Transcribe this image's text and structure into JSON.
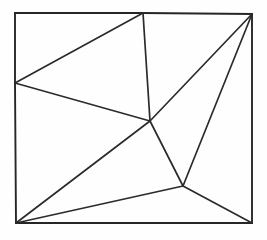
{
  "figure": {
    "canvas": {
      "width": 267,
      "height": 240,
      "background_color": "#fefefe"
    },
    "style": {
      "line_color": "#2b2b2b",
      "frame_color": "#262626",
      "frame_stroke_width": 1.9,
      "interior_stroke_width": 1.7,
      "fill": "none"
    },
    "vertices": [
      {
        "id": "top-left-corner",
        "x": 15,
        "y": 13,
        "on_boundary": true,
        "degree": 2
      },
      {
        "id": "top-edge-node",
        "x": 143,
        "y": 13,
        "on_boundary": true,
        "degree": 4
      },
      {
        "id": "top-right-corner",
        "x": 252,
        "y": 14,
        "on_boundary": true,
        "degree": 4
      },
      {
        "id": "left-edge-node",
        "x": 15,
        "y": 83,
        "on_boundary": true,
        "degree": 4
      },
      {
        "id": "central-hub",
        "x": 150,
        "y": 121,
        "on_boundary": false,
        "degree": 5
      },
      {
        "id": "lower-right-node",
        "x": 183,
        "y": 186,
        "on_boundary": false,
        "degree": 4
      },
      {
        "id": "bottom-left-corner",
        "x": 16,
        "y": 223,
        "on_boundary": true,
        "degree": 4
      },
      {
        "id": "bottom-right-corner",
        "x": 252,
        "y": 223,
        "on_boundary": true,
        "degree": 3
      }
    ],
    "frame_edges": [
      {
        "id": "frame-top-left-segment",
        "x1": 15,
        "y1": 13,
        "x2": 143,
        "y2": 13
      },
      {
        "id": "frame-top-right-segment",
        "x1": 143,
        "y1": 13,
        "x2": 252,
        "y2": 14
      },
      {
        "id": "frame-right",
        "x1": 252,
        "y1": 14,
        "x2": 252,
        "y2": 223
      },
      {
        "id": "frame-bottom",
        "x1": 252,
        "y1": 223,
        "x2": 16,
        "y2": 223
      },
      {
        "id": "frame-left-lower-segment",
        "x1": 16,
        "y1": 223,
        "x2": 15,
        "y2": 83
      },
      {
        "id": "frame-left-upper-segment",
        "x1": 15,
        "y1": 83,
        "x2": 15,
        "y2": 13
      }
    ],
    "interior_edges": [
      {
        "id": "edge-leftnode-to-topnode",
        "from": "left-edge-node",
        "to": "top-edge-node",
        "x1": 15,
        "y1": 83,
        "x2": 143,
        "y2": 13
      },
      {
        "id": "edge-leftnode-to-hub",
        "from": "left-edge-node",
        "to": "central-hub",
        "x1": 15,
        "y1": 83,
        "x2": 150,
        "y2": 121
      },
      {
        "id": "edge-topnode-to-hub",
        "from": "top-edge-node",
        "to": "central-hub",
        "x1": 143,
        "y1": 13,
        "x2": 150,
        "y2": 121
      },
      {
        "id": "edge-hub-to-topright",
        "from": "central-hub",
        "to": "top-right-corner",
        "x1": 150,
        "y1": 121,
        "x2": 252,
        "y2": 14
      },
      {
        "id": "edge-hub-to-lowerright",
        "from": "central-hub",
        "to": "lower-right-node",
        "x1": 150,
        "y1": 121,
        "x2": 183,
        "y2": 186
      },
      {
        "id": "edge-hub-to-bottomleft",
        "from": "central-hub",
        "to": "bottom-left-corner",
        "x1": 150,
        "y1": 121,
        "x2": 16,
        "y2": 223
      },
      {
        "id": "edge-lowerright-to-topright",
        "from": "lower-right-node",
        "to": "top-right-corner",
        "x1": 183,
        "y1": 186,
        "x2": 252,
        "y2": 14
      },
      {
        "id": "edge-lowerright-to-bottomleft",
        "from": "lower-right-node",
        "to": "bottom-left-corner",
        "x1": 183,
        "y1": 186,
        "x2": 16,
        "y2": 223
      },
      {
        "id": "edge-lowerright-to-bottomright",
        "from": "lower-right-node",
        "to": "bottom-right-corner",
        "x1": 183,
        "y1": 186,
        "x2": 252,
        "y2": 223
      }
    ],
    "faces": [
      {
        "id": "face-upper-left-triangle",
        "vertices": [
          "top-left-corner",
          "top-edge-node",
          "left-edge-node"
        ]
      },
      {
        "id": "face-middle-triangle",
        "vertices": [
          "left-edge-node",
          "top-edge-node",
          "central-hub"
        ]
      },
      {
        "id": "face-upper-right-triangle",
        "vertices": [
          "top-edge-node",
          "top-right-corner",
          "central-hub"
        ]
      },
      {
        "id": "face-right-triangle",
        "vertices": [
          "central-hub",
          "top-right-corner",
          "lower-right-node"
        ]
      },
      {
        "id": "face-lower-left-triangle",
        "vertices": [
          "left-edge-node",
          "central-hub",
          "bottom-left-corner"
        ]
      },
      {
        "id": "face-bottom-triangle",
        "vertices": [
          "central-hub",
          "lower-right-node",
          "bottom-left-corner"
        ]
      },
      {
        "id": "face-bottom-right-triangle",
        "vertices": [
          "lower-right-node",
          "top-right-corner",
          "bottom-right-corner"
        ]
      },
      {
        "id": "face-bottom-strip-triangle",
        "vertices": [
          "bottom-left-corner",
          "lower-right-node",
          "bottom-right-corner"
        ]
      }
    ]
  }
}
